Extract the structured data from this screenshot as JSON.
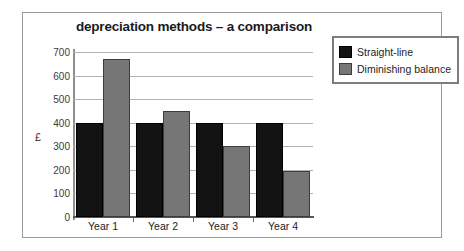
{
  "chart_data": {
    "type": "bar",
    "title": "depreciation methods – a comparison",
    "xlabel": "",
    "ylabel": "£",
    "categories": [
      "Year 1",
      "Year 2",
      "Year 3",
      "Year 4"
    ],
    "series": [
      {
        "name": "Straight-line",
        "color": "#131313",
        "values": [
          400,
          400,
          400,
          400
        ]
      },
      {
        "name": "Diminishing balance",
        "color": "#767676",
        "values": [
          670,
          450,
          300,
          197
        ]
      }
    ],
    "ylim": [
      0,
      700
    ],
    "ytick_labels": [
      "700",
      "600",
      "500",
      "400",
      "300",
      "200",
      "100",
      "0"
    ],
    "ytick_values": [
      700,
      600,
      500,
      400,
      300,
      200,
      100,
      0
    ],
    "grid": true,
    "legend_position": "top-right"
  }
}
